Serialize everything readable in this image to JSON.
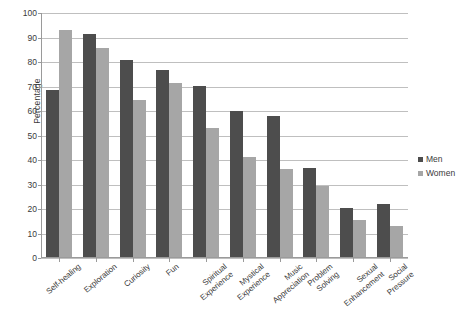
{
  "chart_data": {
    "type": "bar",
    "title": "",
    "xlabel": "",
    "ylabel": "Percentage",
    "ylim": [
      0,
      100
    ],
    "ytick_step": 10,
    "yticks": [
      0,
      10,
      20,
      30,
      40,
      50,
      60,
      70,
      80,
      90,
      100
    ],
    "grid": true,
    "legend_position": "right",
    "categories": [
      "Self-healing",
      "Exploration",
      "Curiosity",
      "Fun",
      "Spiritual Experience",
      "Mystical Experience",
      "Music Appreciation",
      "Problem Solving",
      "Sexual Enhancement",
      "Social Pressure"
    ],
    "series": [
      {
        "name": "Men",
        "color": "#4d4d4d",
        "values": [
          68.5,
          91.3,
          81.0,
          76.8,
          70.4,
          60.0,
          57.8,
          36.9,
          20.3,
          22.2
        ]
      },
      {
        "name": "Women",
        "color": "#a6a6a6",
        "values": [
          93.0,
          85.7,
          64.7,
          71.5,
          53.1,
          41.3,
          36.5,
          29.4,
          15.4,
          12.9
        ]
      }
    ]
  },
  "legend": {
    "items": [
      {
        "label": "Men",
        "swatch_class": "sw-men"
      },
      {
        "label": "Women",
        "swatch_class": "sw-women"
      }
    ]
  }
}
